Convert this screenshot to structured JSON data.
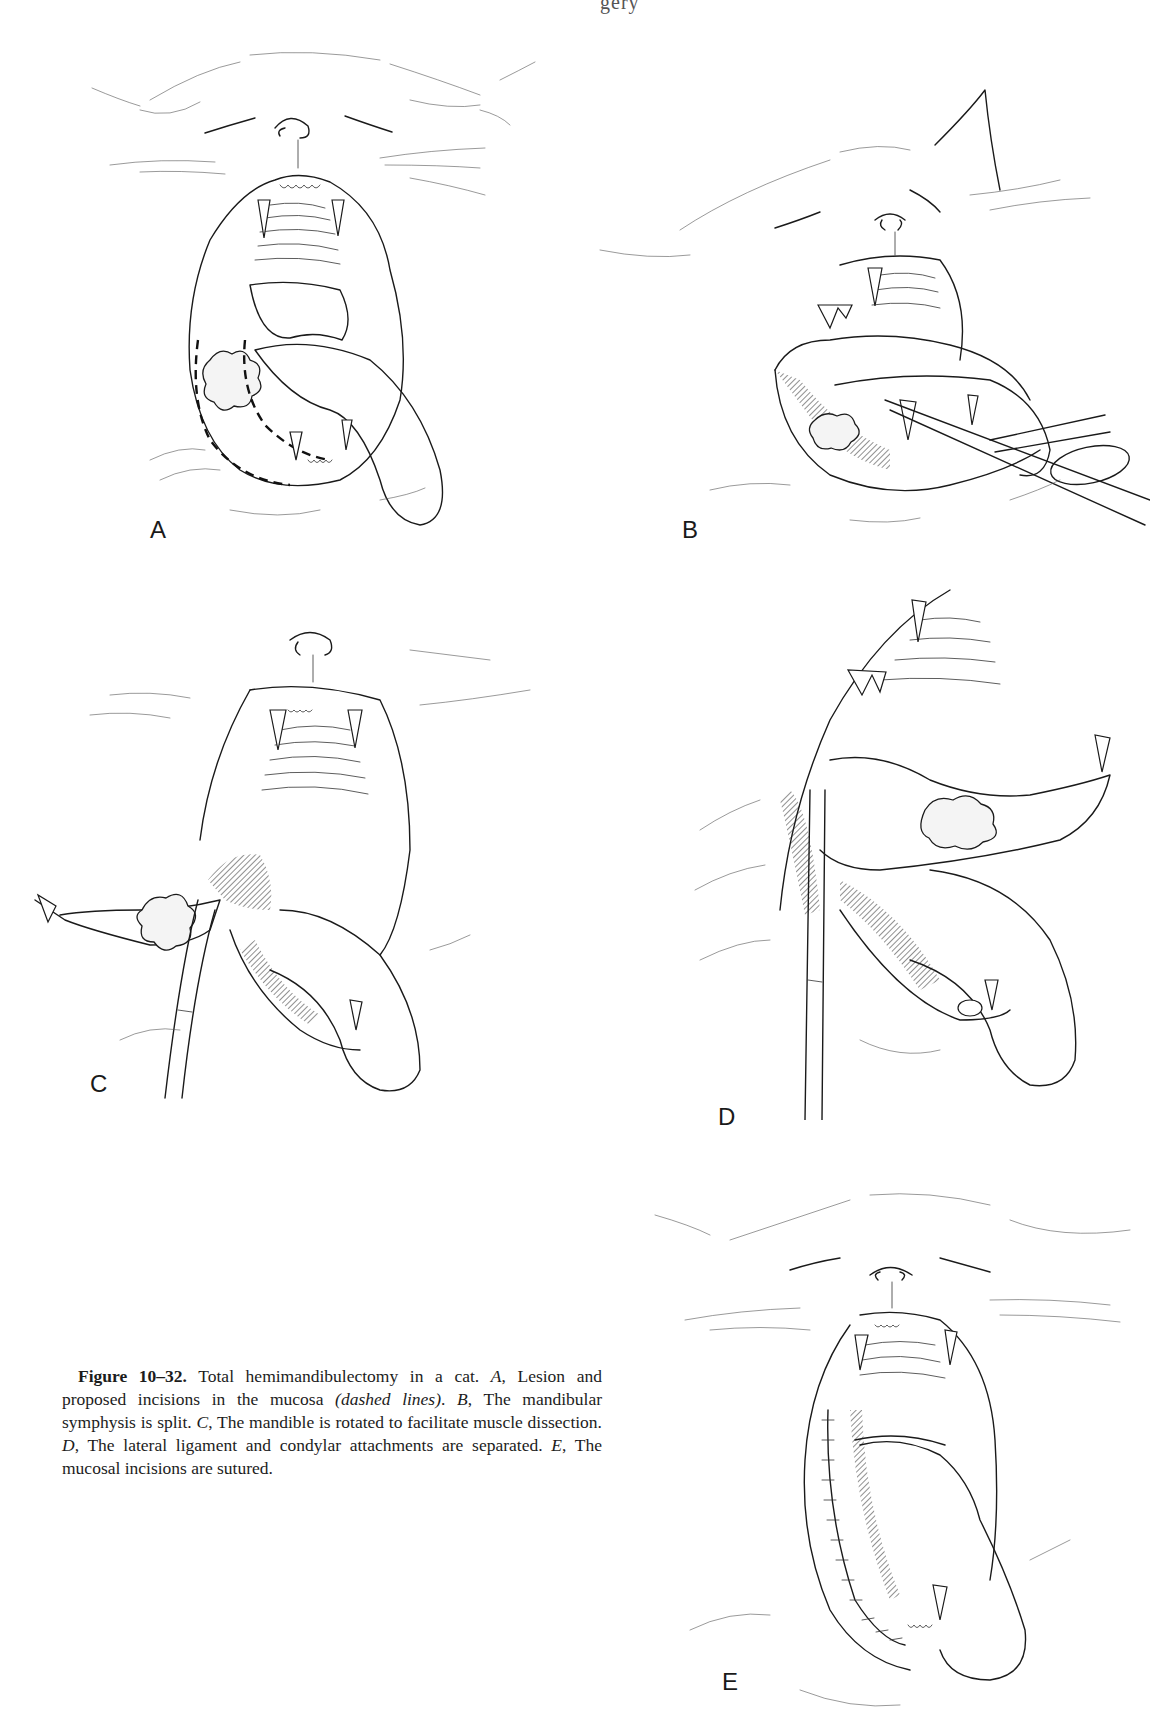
{
  "page": {
    "running_header_fragment": "gery"
  },
  "figure": {
    "number_label": "Figure 10–32.",
    "caption_segments": [
      {
        "text": " Total hemimandibulectomy in a cat. ",
        "style": "normal"
      },
      {
        "text": "A",
        "style": "italic"
      },
      {
        "text": ", Lesion and proposed incisions in the mucosa ",
        "style": "normal"
      },
      {
        "text": "(dashed lines)",
        "style": "italic"
      },
      {
        "text": ". ",
        "style": "normal"
      },
      {
        "text": "B",
        "style": "italic"
      },
      {
        "text": ", The mandibular symphysis is split. ",
        "style": "normal"
      },
      {
        "text": "C",
        "style": "italic"
      },
      {
        "text": ", The mandible is rotated to facilitate muscle dissection. ",
        "style": "normal"
      },
      {
        "text": "D",
        "style": "italic"
      },
      {
        "text": ", The lateral ligament and condylar attachments are separated. ",
        "style": "normal"
      },
      {
        "text": "E",
        "style": "italic"
      },
      {
        "text": ", The mucosal incisions are sutured.",
        "style": "normal"
      }
    ],
    "panels": [
      {
        "label": "A",
        "description": "Cat with open mouth; lesion on left mandible with dashed incision lines"
      },
      {
        "label": "B",
        "description": "Mandibular symphysis split with surgical scissors/instrument"
      },
      {
        "label": "C",
        "description": "Mandible rotated outward with forceps; tumor mass visible"
      },
      {
        "label": "D",
        "description": "Mandible retracted; lateral ligament and condylar attachments separated"
      },
      {
        "label": "E",
        "description": "Mucosal incisions sutured along left side of mouth"
      }
    ]
  }
}
